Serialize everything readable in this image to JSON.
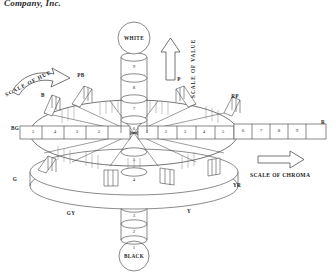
{
  "header": {
    "text": "Company, Inc."
  },
  "diagram": {
    "poles": {
      "top_label": "WHITE",
      "bottom_label": "BLACK"
    },
    "axis_labels": {
      "value": "SCALE OF VALUE",
      "hue": "SCALE OF HUE",
      "chroma": "SCALE OF CHROMA"
    },
    "value_scale": {
      "name": "SCALE OF VALUE",
      "direction": "upward",
      "steps": [
        "9",
        "8",
        "7",
        "6",
        "5",
        "4",
        "3",
        "2",
        "1"
      ],
      "top_anchor": "WHITE",
      "bottom_anchor": "BLACK"
    },
    "chroma_scale_right": {
      "name": "SCALE OF CHROMA",
      "direction": "outward",
      "steps": [
        "1",
        "2",
        "3",
        "4",
        "5",
        "6",
        "7",
        "8",
        "9"
      ],
      "terminal_label": "R"
    },
    "chroma_scale_left": {
      "steps": [
        "5",
        "4",
        "3",
        "2"
      ],
      "terminal_label": "BG"
    },
    "hue_labels": [
      {
        "code": "PB",
        "position": "upper-left"
      },
      {
        "code": "B",
        "position": "left-upper"
      },
      {
        "code": "BG",
        "position": "left"
      },
      {
        "code": "G",
        "position": "lower-left"
      },
      {
        "code": "GY",
        "position": "bottom-left"
      },
      {
        "code": "Y",
        "position": "bottom-right"
      },
      {
        "code": "YR",
        "position": "right-lower"
      },
      {
        "code": "R",
        "position": "right"
      },
      {
        "code": "RP",
        "position": "right-upper"
      },
      {
        "code": "P",
        "position": "upper-right"
      }
    ],
    "colors": {
      "ink": "#2a2a2a",
      "line": "#3a3a3a",
      "hatch": "#6b6b6b",
      "background": "#ffffff"
    }
  }
}
